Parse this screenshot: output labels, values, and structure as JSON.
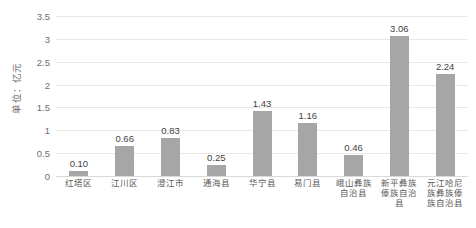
{
  "chart_data": {
    "type": "bar",
    "title": "",
    "xlabel": "",
    "ylabel": "单位：亿元",
    "categories": [
      "红塔区",
      "江川区",
      "澄江市",
      "通海县",
      "华宁县",
      "易门县",
      "峨山彝族自治县",
      "新平彝族傣族自治县",
      "元江哈尼族彝族傣族自治县"
    ],
    "values": [
      0.1,
      0.66,
      0.83,
      0.25,
      1.43,
      1.16,
      0.46,
      3.06,
      2.24
    ],
    "value_labels": [
      "0.10",
      "0.66",
      "0.83",
      "0.25",
      "1.43",
      "1.16",
      "0.46",
      "3.06",
      "2.24"
    ],
    "ylim": [
      0,
      3.5
    ],
    "yticks": [
      0,
      0.5,
      1,
      1.5,
      2,
      2.5,
      3,
      3.5
    ],
    "ytick_labels": [
      "0",
      "0.5",
      "1",
      "1.5",
      "2",
      "2.5",
      "3",
      "3.5"
    ],
    "grid": true,
    "legend": false,
    "legend_position": "none",
    "bar_color": "#a6a6a6",
    "gridline_color": "#e8e8e8",
    "axis_text_color": "#6e6e6e",
    "value_label_color": "#3f3f3f"
  }
}
